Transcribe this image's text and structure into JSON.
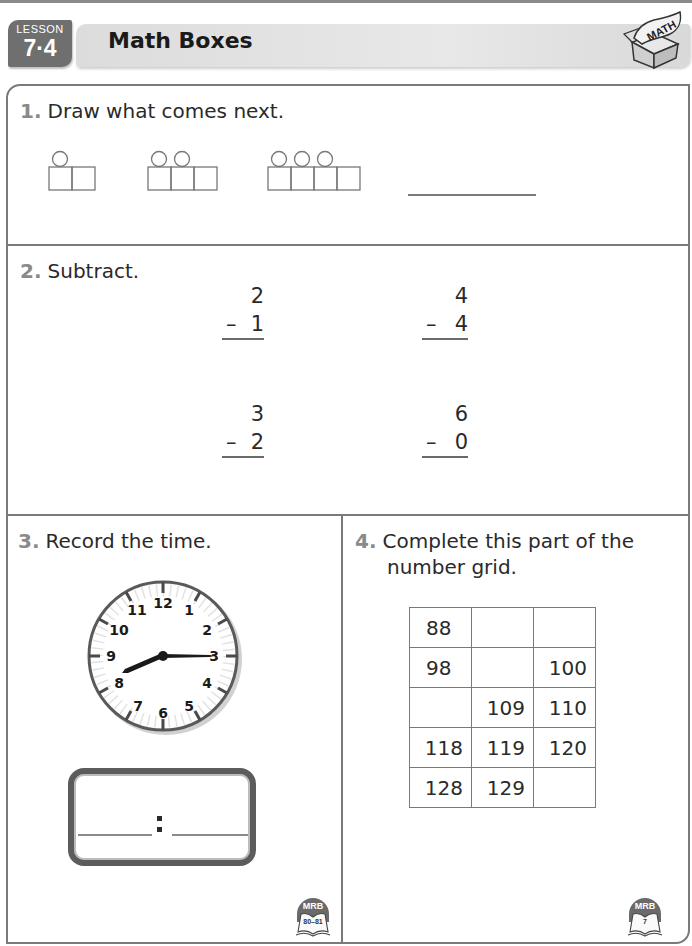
{
  "header": {
    "lesson_label": "LESSON",
    "lesson_number": "7·4",
    "title": "Math Boxes",
    "logo_text": "MATH"
  },
  "problems": [
    {
      "number": "1.",
      "prompt": "Draw what comes next.",
      "pattern": [
        {
          "circles": 1,
          "squares": 2
        },
        {
          "circles": 2,
          "squares": 3
        },
        {
          "circles": 3,
          "squares": 4
        }
      ],
      "answer_blank": ""
    },
    {
      "number": "2.",
      "prompt": "Subtract.",
      "items": [
        {
          "top": "2",
          "operator": "–",
          "bottom": "1"
        },
        {
          "top": "4",
          "operator": "–",
          "bottom": "4"
        },
        {
          "top": "3",
          "operator": "–",
          "bottom": "2"
        },
        {
          "top": "6",
          "operator": "–",
          "bottom": "0"
        }
      ]
    },
    {
      "number": "3.",
      "prompt": "Record the time.",
      "clock": {
        "numbers": [
          "12",
          "1",
          "2",
          "3",
          "4",
          "5",
          "6",
          "7",
          "8",
          "9",
          "10",
          "11"
        ],
        "hour_hand_points_to": "between 8 and 9",
        "minute_hand_points_to": "3"
      },
      "time_answer": {
        "hours": "",
        "separator": ":",
        "minutes": ""
      },
      "reference": {
        "badge": "MRB",
        "pages": "80–81"
      }
    },
    {
      "number": "4.",
      "prompt_line1": "Complete this part of the",
      "prompt_line2": "number grid.",
      "grid": [
        [
          "88",
          "",
          ""
        ],
        [
          "98",
          "",
          "100"
        ],
        [
          "",
          "109",
          "110"
        ],
        [
          "118",
          "119",
          "120"
        ],
        [
          "128",
          "129",
          ""
        ]
      ],
      "reference": {
        "badge": "MRB",
        "pages": "7"
      }
    }
  ]
}
